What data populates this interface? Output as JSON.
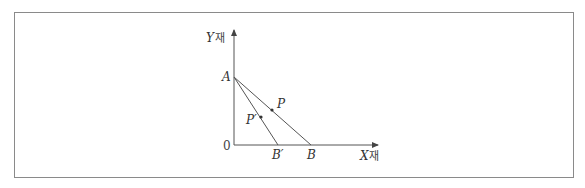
{
  "diagram": {
    "axes": {
      "y_label_var": "Y",
      "y_label_suffix": "재",
      "x_label_var": "X",
      "x_label_suffix": "재",
      "origin_label": "0"
    },
    "points": {
      "A": "A",
      "B": "B",
      "B_prime": "B′",
      "P": "P",
      "P_prime": "P′"
    },
    "lines": [
      {
        "name": "budget-line-AB",
        "from": "A",
        "to": "B"
      },
      {
        "name": "budget-line-AB-prime",
        "from": "A",
        "to": "B′"
      }
    ],
    "colors": {
      "line": "#555555",
      "frame": "#8a8a8a"
    }
  }
}
